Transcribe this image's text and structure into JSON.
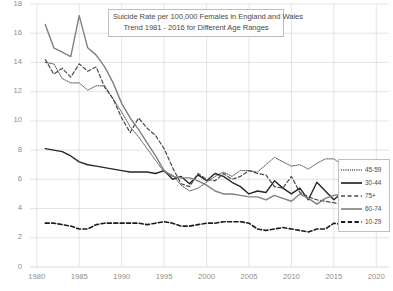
{
  "chart_data": {
    "type": "line",
    "title": "Suicide Rate per 100,000 Females in England and Wales",
    "subtitle": "Trend 1981 - 2016 for Different Age Ranges",
    "xlabel": "",
    "ylabel": "",
    "xlim": [
      1979.2,
      2021.5
    ],
    "ylim": [
      0,
      18
    ],
    "grid": true,
    "legend_position": "right-middle",
    "yticks": [
      0,
      2,
      4,
      6,
      8,
      10,
      12,
      14,
      16,
      18
    ],
    "xticks": [
      1980,
      1985,
      1990,
      1995,
      2000,
      2005,
      2010,
      2015,
      2020
    ],
    "x": [
      1981,
      1982,
      1983,
      1984,
      1985,
      1986,
      1987,
      1988,
      1989,
      1990,
      1991,
      1992,
      1993,
      1994,
      1995,
      1996,
      1997,
      1998,
      1999,
      2000,
      2001,
      2002,
      2003,
      2004,
      2005,
      2006,
      2007,
      2008,
      2009,
      2010,
      2011,
      2012,
      2013,
      2014,
      2015,
      2016
    ],
    "series": [
      {
        "name": "45-59",
        "style": "dotted",
        "color": "#595959",
        "values": [
          14.0,
          13.9,
          12.9,
          12.6,
          12.6,
          12.1,
          12.4,
          12.4,
          11.5,
          10.6,
          9.6,
          8.9,
          8.1,
          7.3,
          6.5,
          6.3,
          5.6,
          5.2,
          5.4,
          5.8,
          6.2,
          6.5,
          6.2,
          6.6,
          6.6,
          6.5,
          7.0,
          7.5,
          7.2,
          6.9,
          7.0,
          6.7,
          7.1,
          7.4,
          7.4,
          7.0
        ]
      },
      {
        "name": "30-44",
        "style": "solid",
        "color": "#262626",
        "values": [
          8.1,
          8.0,
          7.9,
          7.6,
          7.2,
          7.0,
          6.9,
          6.8,
          6.7,
          6.6,
          6.5,
          6.5,
          6.5,
          6.4,
          6.6,
          6.0,
          6.2,
          5.7,
          6.3,
          5.9,
          6.4,
          6.2,
          5.8,
          5.5,
          5.0,
          5.2,
          5.1,
          5.9,
          5.4,
          5.0,
          5.4,
          4.6,
          5.8,
          5.2,
          4.6,
          5.1
        ]
      },
      {
        "name": "75+",
        "style": "dashed",
        "color": "#4a4a4a",
        "values": [
          14.2,
          13.2,
          13.6,
          13.0,
          13.9,
          13.4,
          13.7,
          12.3,
          11.5,
          10.2,
          9.2,
          10.2,
          9.5,
          9.0,
          8.1,
          6.8,
          5.7,
          5.5,
          6.4,
          6.0,
          5.9,
          6.4,
          6.0,
          6.2,
          6.6,
          6.4,
          6.3,
          5.5,
          5.4,
          6.2,
          5.1,
          4.8,
          4.6,
          4.5,
          4.4,
          4.3
        ]
      },
      {
        "name": "60-74",
        "style": "solid",
        "color": "#808080",
        "values": [
          16.6,
          15.0,
          14.7,
          14.4,
          17.2,
          15.0,
          14.5,
          13.7,
          12.6,
          11.2,
          10.2,
          9.4,
          8.5,
          7.6,
          6.6,
          6.2,
          6.1,
          6.1,
          5.9,
          5.6,
          5.2,
          5.0,
          5.0,
          4.9,
          4.8,
          4.8,
          4.6,
          4.9,
          4.7,
          4.5,
          5.0,
          4.7,
          4.3,
          4.7,
          4.9,
          5.0
        ]
      },
      {
        "name": "10-29",
        "style": "dashed-bold",
        "color": "#1a1a1a",
        "values": [
          3.0,
          3.0,
          2.9,
          2.8,
          2.6,
          2.6,
          2.9,
          3.0,
          3.0,
          3.0,
          3.0,
          3.0,
          2.9,
          3.0,
          3.1,
          3.0,
          2.8,
          2.8,
          2.9,
          3.0,
          3.0,
          3.1,
          3.1,
          3.1,
          3.0,
          2.6,
          2.5,
          2.6,
          2.7,
          2.6,
          2.5,
          2.4,
          2.6,
          2.6,
          3.0,
          2.9
        ]
      }
    ]
  },
  "axis": {
    "ytick_labels": [
      "18",
      "16",
      "14",
      "12",
      "10",
      "8",
      "6",
      "4",
      "2",
      "0"
    ],
    "xtick_labels": [
      "1980",
      "1985",
      "1990",
      "1995",
      "2000",
      "2005",
      "2010",
      "2015",
      "2020"
    ]
  },
  "legend": {
    "items": [
      {
        "label": "45-59"
      },
      {
        "label": "30-44"
      },
      {
        "label": "75+"
      },
      {
        "label": "60-74"
      },
      {
        "label": "10-29"
      }
    ]
  },
  "colors": {
    "grid": "#d9d9d9",
    "text": "#8c8c8c",
    "title_text": "#4a4a4a",
    "box_border": "#bfbfbf",
    "background": "#ffffff"
  }
}
